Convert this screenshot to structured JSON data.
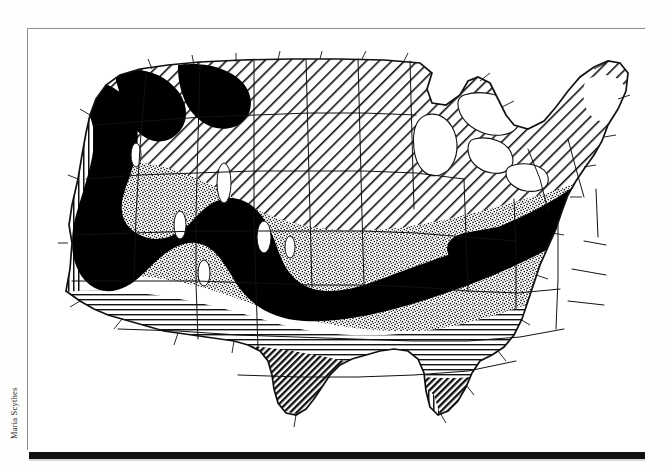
{
  "page": {
    "background_color": "#fdfdfb",
    "credit_line": "Maria Scythes"
  },
  "figure": {
    "frame_color": "#8e8e8e",
    "plate_background": "#ffffff",
    "rule_color": "#111111",
    "title": "",
    "caption": ""
  },
  "map": {
    "name": "contiguous-united-states-thematic-map",
    "projection_note": "conterminous United States with state boundaries",
    "ink_color": "#000000",
    "paper_color": "#ffffff",
    "legend_present": false,
    "patterns": [
      {
        "id": "vertical-hatch",
        "label": "vertical line fill",
        "density": "medium"
      },
      {
        "id": "diagonal-hatch",
        "label": "diagonal line fill",
        "density": "medium"
      },
      {
        "id": "dense-diagonal-hatch",
        "label": "dense diagonal line fill",
        "density": "high"
      },
      {
        "id": "horizontal-hatch",
        "label": "horizontal line fill",
        "density": "medium"
      },
      {
        "id": "stipple",
        "label": "stippled dot fill",
        "density": "medium"
      },
      {
        "id": "solid-black",
        "label": "solid black band",
        "density": "solid"
      },
      {
        "id": "white",
        "label": "unfilled white",
        "density": "none"
      }
    ],
    "regions": [
      {
        "name": "pacific-coast",
        "pattern": "vertical-hatch"
      },
      {
        "name": "northern-plains-and-great-lakes-north",
        "pattern": "diagonal-hatch"
      },
      {
        "name": "interior-west-and-midwest",
        "pattern": "stipple"
      },
      {
        "name": "central-diagonal-belt",
        "pattern": "solid-black"
      },
      {
        "name": "southern-tier",
        "pattern": "horizontal-hatch"
      },
      {
        "name": "deep-south-and-texas-interior",
        "pattern": "dense-diagonal-hatch"
      },
      {
        "name": "gulf-coast-and-florida-margin",
        "pattern": "vertical-hatch"
      },
      {
        "name": "great-lakes-water",
        "pattern": "white"
      },
      {
        "name": "northern-new-england",
        "pattern": "white"
      }
    ]
  }
}
